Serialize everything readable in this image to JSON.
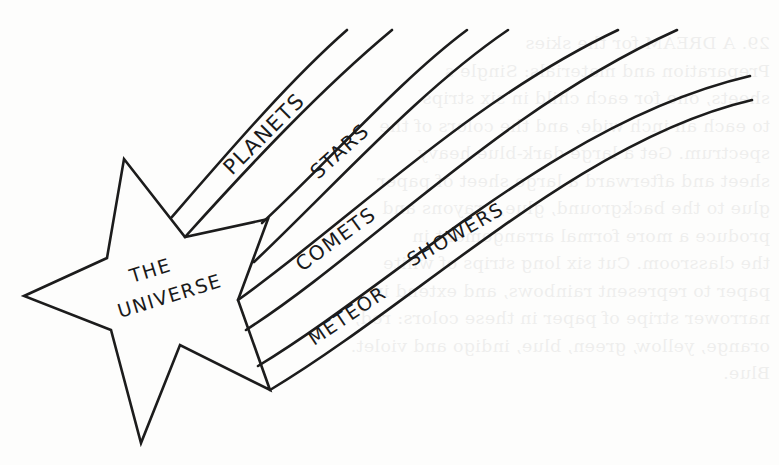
{
  "figure": {
    "center_label_line1": "THE",
    "center_label_line2": "UNIVERSE",
    "bands": [
      {
        "id": "planets",
        "label": "PLANETS"
      },
      {
        "id": "stars",
        "label": "STARS"
      },
      {
        "id": "comets",
        "label": "COMETS"
      },
      {
        "id": "meteor-showers",
        "label_part1": "METEOR",
        "label_part2": "SHOWERS"
      }
    ],
    "ink_color": "#1c1c1c",
    "paper_color": "#fdfdfc"
  },
  "bleed_through": {
    "lines": [
      "29. A DREAM for the skies",
      "Preparation and materials: Single s",
      "sheets, one for each child in six strips",
      "to each an inch wide, and the colors of the",
      "spectrum. Get a large dark-blue heavy",
      "sheet and afterward a large sheet of paper",
      "glue to the background, glue, crayons and",
      "produce a more formal arrangement in",
      "the classroom. Cut six long strips of white",
      "paper to represent rainbows, and extend in",
      "narrower stripe of paper in these colors: red,",
      "orange, yellow, green, blue, indigo and violet.",
      "Blue."
    ]
  }
}
